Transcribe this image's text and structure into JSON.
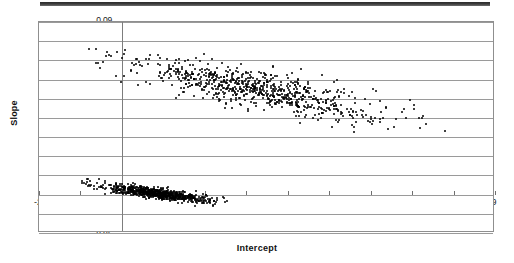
{
  "figure": {
    "background_color": "#ffffff",
    "frame_color": "#8f8f8f",
    "grid_color": "#9a9a9a",
    "marker_color": "#000000"
  },
  "axis_titles": {
    "y": "Slope",
    "x": "Intercept"
  },
  "chart_data": {
    "type": "scatter",
    "title": "",
    "xlabel": "Intercept",
    "ylabel": "Slope",
    "xlim": [
      -2,
      9
    ],
    "ylim": [
      -0.02,
      0.09
    ],
    "xticks": [
      -2,
      -1,
      0,
      1,
      2,
      3,
      4,
      5,
      6,
      7,
      8,
      9
    ],
    "xtick_labels": [
      "-2",
      "-1",
      "0",
      "1",
      "2",
      "3",
      "4",
      "5",
      "6",
      "7",
      "8",
      "9"
    ],
    "yticks": [
      0.09,
      0.08,
      0.07,
      0.06,
      0.05,
      0.04,
      0.03,
      0.02,
      0.01,
      0,
      -0.01,
      -0.02
    ],
    "ytick_labels": [
      "0.09",
      "0.08",
      "0.07",
      "0.06",
      "0.05",
      "0.04",
      "0.03",
      "0.02",
      "0.01",
      "0",
      "-0.01",
      "-0.02"
    ],
    "grid": true,
    "grid_axis": "y",
    "legend": false,
    "marker_size_px": 2,
    "series": [
      {
        "name": "upper-cluster",
        "point_count": 760,
        "description": "Dense elongated negatively-correlated band of points",
        "x_range": [
          -0.9,
          7.8
        ],
        "y_range": [
          0.033,
          0.078
        ],
        "x_center": 3.3,
        "y_center": 0.055,
        "correlation": -0.78,
        "trend_slope_per_unit_x": -0.0042,
        "trend_intercept": 0.0688,
        "y_scatter_sd": 0.0048
      },
      {
        "name": "lower-cluster",
        "point_count": 760,
        "description": "Very dense compact negatively-correlated cloud near zero slope",
        "x_range": [
          -1.0,
          2.5
        ],
        "y_range": [
          -0.007,
          0.009
        ],
        "x_center": 0.85,
        "y_center": 0.001,
        "correlation": -0.72,
        "trend_slope_per_unit_x": -0.0028,
        "trend_intercept": 0.0035,
        "y_scatter_sd": 0.0014
      }
    ]
  }
}
